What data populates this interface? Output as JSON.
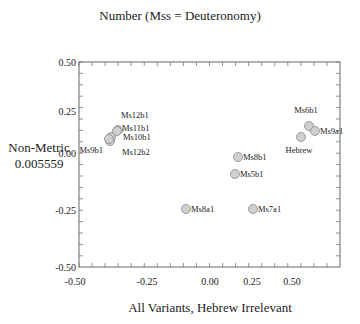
{
  "chart_data": {
    "type": "scatter",
    "title": "Number (Mss = Deuteronomy)",
    "xlabel": "All Variants, Hebrew Irrelevant",
    "ylabel": "Non-Metric",
    "ylabel_sub": "0.005559",
    "xlim": [
      -0.5,
      0.5
    ],
    "ylim": [
      -0.5,
      0.5
    ],
    "x_ticks": [
      "-0.50",
      "-0.25",
      "0.00",
      "0.25",
      "0.50"
    ],
    "y_ticks": [
      "0.50",
      "0.25",
      "0.00",
      "-0.25",
      "-0.50"
    ],
    "grid": false,
    "legend": null,
    "marker_color": "#cfcfcf",
    "marker_edge": "#888888",
    "points": [
      {
        "label": "Ms12b1",
        "x": -0.27,
        "y": 0.12
      },
      {
        "label": "Ms11b1",
        "x": -0.27,
        "y": 0.1
      },
      {
        "label": "Ms10b1",
        "x": -0.29,
        "y": 0.07
      },
      {
        "label": "Ms12b2",
        "x": -0.29,
        "y": 0.05
      },
      {
        "label": "Ms9b1",
        "x": -0.3,
        "y": 0.06
      },
      {
        "label": "Ms8b1",
        "x": 0.17,
        "y": -0.02
      },
      {
        "label": "Ms5b1",
        "x": 0.15,
        "y": -0.09
      },
      {
        "label": "Ms8a1",
        "x": -0.1,
        "y": -0.25
      },
      {
        "label": "Ms7a1",
        "x": 0.24,
        "y": -0.25
      },
      {
        "label": "Ms6b1",
        "x": 0.55,
        "y": 0.12
      },
      {
        "label": "Ms9a1",
        "x": 0.59,
        "y": 0.1
      },
      {
        "label": "Hebrew",
        "x": 0.51,
        "y": 0.08
      }
    ]
  }
}
